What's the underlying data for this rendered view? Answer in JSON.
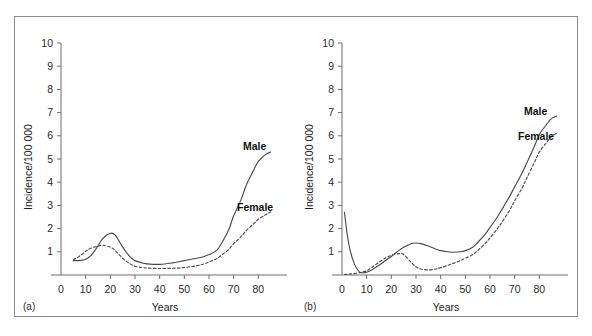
{
  "figure": {
    "panels": [
      {
        "caption": "(a)",
        "ylabel": "Incidence/100 000",
        "xlabel": "Years",
        "series_labels": {
          "male": "Male",
          "female": "Female"
        }
      },
      {
        "caption": "(b)",
        "ylabel": "Incidence/100 000",
        "xlabel": "Years",
        "series_labels": {
          "male": "Male",
          "female": "Female"
        }
      }
    ],
    "colors": {
      "axis": "#6f6f6f",
      "line": "#4a4a4a",
      "frame": "#8c8c8c",
      "text": "#1a1a1a",
      "background": "#ffffff"
    }
  },
  "chart_data": [
    {
      "type": "line",
      "title": "(a)",
      "xlabel": "Years",
      "ylabel": "Incidence/100 000",
      "xlim": [
        0,
        90
      ],
      "ylim": [
        0,
        10
      ],
      "xticks": [
        0,
        10,
        20,
        30,
        40,
        50,
        60,
        70,
        80
      ],
      "xtick_labels": [
        "0",
        "10",
        "20",
        "30",
        "40",
        "50",
        "60",
        "70",
        "80"
      ],
      "yticks": [
        1,
        2,
        3,
        4,
        5,
        6,
        7,
        8,
        9,
        10
      ],
      "ytick_labels": [
        "1",
        "2",
        "3",
        "4",
        "5",
        "6",
        "7",
        "8",
        "9",
        "10"
      ],
      "grid": false,
      "legend": "inline-annotation",
      "x": [
        5,
        8,
        10,
        12,
        15,
        17,
        20,
        22,
        25,
        28,
        30,
        33,
        35,
        40,
        45,
        50,
        55,
        58,
        60,
        63,
        65,
        68,
        70,
        73,
        75,
        78,
        80,
        83,
        85
      ],
      "series": [
        {
          "name": "Male",
          "style": "solid",
          "values": [
            0.62,
            0.63,
            0.68,
            0.82,
            1.25,
            1.58,
            1.8,
            1.72,
            1.2,
            0.78,
            0.62,
            0.52,
            0.48,
            0.46,
            0.52,
            0.62,
            0.72,
            0.8,
            0.88,
            1.05,
            1.35,
            1.95,
            2.55,
            3.25,
            3.85,
            4.5,
            4.9,
            5.2,
            5.3
          ]
        },
        {
          "name": "Female",
          "style": "dashed",
          "values": [
            0.65,
            0.85,
            1.02,
            1.15,
            1.25,
            1.28,
            1.2,
            1.05,
            0.72,
            0.48,
            0.38,
            0.32,
            0.3,
            0.28,
            0.29,
            0.32,
            0.4,
            0.48,
            0.56,
            0.7,
            0.85,
            1.1,
            1.35,
            1.65,
            1.9,
            2.2,
            2.4,
            2.6,
            2.72
          ]
        }
      ]
    },
    {
      "type": "line",
      "title": "(b)",
      "xlabel": "Years",
      "ylabel": "Incidence/100 000",
      "xlim": [
        0,
        90
      ],
      "ylim": [
        0,
        10
      ],
      "xticks": [
        0,
        10,
        20,
        30,
        40,
        50,
        60,
        70,
        80
      ],
      "xtick_labels": [
        "0",
        "10",
        "20",
        "30",
        "40",
        "50",
        "60",
        "70",
        "80"
      ],
      "yticks": [
        1,
        2,
        3,
        4,
        5,
        6,
        7,
        8,
        9,
        10
      ],
      "ytick_labels": [
        "1",
        "2",
        "3",
        "4",
        "5",
        "6",
        "7",
        "8",
        "9",
        "10"
      ],
      "grid": false,
      "legend": "inline-annotation",
      "x": [
        1,
        2,
        3,
        5,
        7,
        8,
        10,
        12,
        15,
        18,
        20,
        23,
        25,
        28,
        30,
        32,
        35,
        38,
        40,
        43,
        45,
        48,
        50,
        53,
        55,
        58,
        60,
        63,
        65,
        68,
        70,
        73,
        75,
        78,
        80,
        83,
        85,
        87
      ],
      "series": [
        {
          "name": "Male",
          "style": "solid",
          "values": [
            2.7,
            1.85,
            1.2,
            0.48,
            0.14,
            0.1,
            0.12,
            0.22,
            0.42,
            0.65,
            0.8,
            1.05,
            1.2,
            1.35,
            1.38,
            1.35,
            1.25,
            1.12,
            1.05,
            1.0,
            0.98,
            1.0,
            1.05,
            1.2,
            1.4,
            1.75,
            2.05,
            2.5,
            2.85,
            3.4,
            3.8,
            4.4,
            4.85,
            5.55,
            6.05,
            6.5,
            6.75,
            6.85
          ]
        },
        {
          "name": "Female",
          "style": "dashed",
          "values": [
            0.02,
            0.03,
            0.04,
            0.06,
            0.1,
            0.12,
            0.18,
            0.32,
            0.55,
            0.75,
            0.85,
            0.92,
            0.88,
            0.55,
            0.35,
            0.26,
            0.22,
            0.26,
            0.32,
            0.42,
            0.5,
            0.62,
            0.72,
            0.88,
            1.05,
            1.35,
            1.6,
            2.0,
            2.3,
            2.8,
            3.2,
            3.75,
            4.2,
            4.85,
            5.3,
            5.72,
            5.98,
            6.1
          ]
        }
      ]
    }
  ]
}
